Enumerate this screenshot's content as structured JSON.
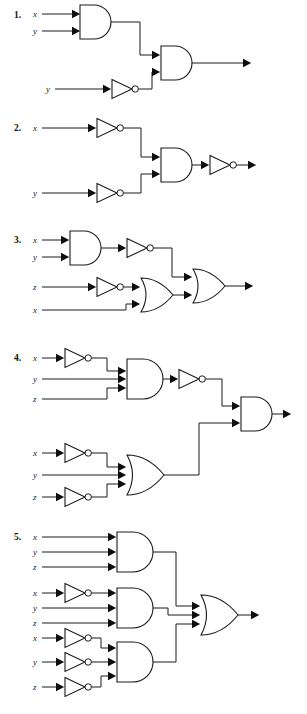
{
  "page": {
    "background_color": "#ffffff",
    "line_color": "#1a1a1a",
    "width": 307,
    "height": 714
  },
  "circuits": [
    {
      "number": "1.",
      "inputs": [
        "x",
        "y",
        "y"
      ],
      "gates": [
        "AND",
        "NOT",
        "AND"
      ],
      "expression": "(x AND y) AND (NOT y)",
      "output_label": ""
    },
    {
      "number": "2.",
      "inputs": [
        "x",
        "y"
      ],
      "gates": [
        "NOT",
        "NOT",
        "AND",
        "NOT"
      ],
      "expression": "NOT((NOT x) AND (NOT y))",
      "output_label": ""
    },
    {
      "number": "3.",
      "inputs": [
        "x",
        "y",
        "z",
        "x"
      ],
      "gates": [
        "AND",
        "NOT",
        "NOT",
        "OR",
        "OR"
      ],
      "expression": "NOT(x AND y) OR ((NOT z) OR x)",
      "output_label": ""
    },
    {
      "number": "4.",
      "inputs": [
        "x",
        "y",
        "z",
        "x",
        "y",
        "z"
      ],
      "gates": [
        "NOT",
        "AND",
        "NOT",
        "NOT",
        "NOT",
        "OR",
        "AND"
      ],
      "expression": "NOT((NOT x) AND y AND z) AND ((NOT x) OR y OR (NOT z))",
      "output_label": ""
    },
    {
      "number": "5.",
      "inputs": [
        "x",
        "y",
        "z",
        "x",
        "y",
        "z",
        "x",
        "y",
        "z"
      ],
      "gates": [
        "AND",
        "NOT",
        "AND",
        "NOT",
        "NOT",
        "NOT",
        "AND",
        "OR"
      ],
      "expression": "(x AND y AND z) OR ((NOT x) AND y AND z) OR ((NOT x) AND (NOT y) AND (NOT z))",
      "output_label": ""
    }
  ],
  "symbols": {
    "and_gate": "and-gate",
    "or_gate": "or-gate",
    "not_gate": "not-gate",
    "inverter_bubble": "inversion-bubble",
    "input_arrow": "input-arrowhead",
    "output_arrow": "output-arrowhead",
    "wire": "wire"
  }
}
